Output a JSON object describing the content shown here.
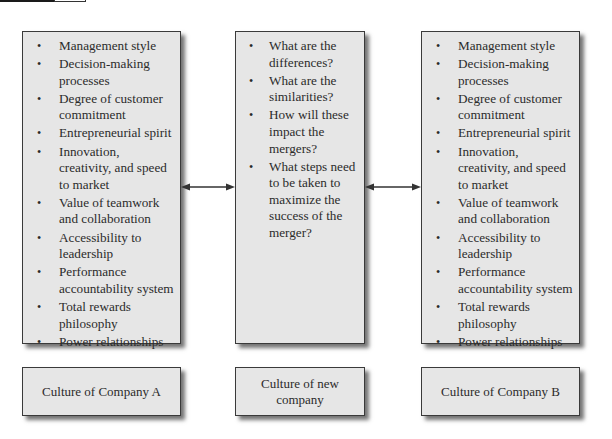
{
  "company_a": {
    "title": "Culture of Company A",
    "items": [
      "Management style",
      "Decision-making processes",
      "Degree of customer commitment",
      "Entrepreneurial spirit",
      "Innovation, creativity, and speed to market",
      "Value of teamwork and collaboration",
      "Accessibility to leadership",
      "Performance accountability system",
      "Total rewards philosophy",
      "Power relationships"
    ]
  },
  "new_company": {
    "title": "Culture of new company",
    "items": [
      "What are the differences?",
      "What are the similarities?",
      "How will these impact the mergers?",
      "What steps need to be taken to maximize the success of the merger?"
    ]
  },
  "company_b": {
    "title": "Culture of Company B",
    "items": [
      "Management style",
      "Decision-making processes",
      "Degree of customer commitment",
      "Entrepreneurial spirit",
      "Innovation, creativity, and speed to market",
      "Value of teamwork and collaboration",
      "Accessibility to leadership",
      "Performance accountability system",
      "Total rewards philosophy",
      "Power relationships"
    ]
  },
  "connectors": [
    {
      "from": "company_a",
      "to": "new_company",
      "type": "double-arrow"
    },
    {
      "from": "new_company",
      "to": "company_b",
      "type": "double-arrow"
    }
  ],
  "colors": {
    "box_fill": "#e6e6e6",
    "box_border": "#3a3a3a",
    "text": "#2b2b2b",
    "arrow": "#333333"
  }
}
